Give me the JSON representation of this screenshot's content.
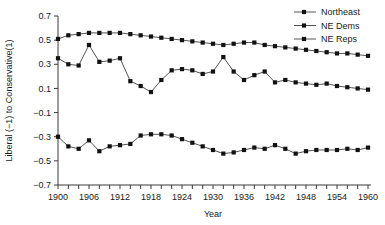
{
  "chart_data": {
    "type": "line",
    "title": "",
    "xlabel": "Year",
    "ylabel": "Liberal (−1) to Conservative(1)",
    "xlim": [
      1900,
      1960
    ],
    "ylim": [
      -0.7,
      0.7
    ],
    "xticks": [
      1900,
      1902,
      1904,
      1906,
      1908,
      1910,
      1912,
      1914,
      1916,
      1918,
      1920,
      1922,
      1924,
      1926,
      1928,
      1930,
      1932,
      1934,
      1936,
      1938,
      1940,
      1942,
      1944,
      1946,
      1948,
      1950,
      1952,
      1954,
      1956,
      1958,
      1960
    ],
    "xtick_labels": [
      "1900",
      "1906",
      "1912",
      "1918",
      "1924",
      "1930",
      "1936",
      "1942",
      "1948",
      "1954",
      "1960"
    ],
    "xtick_label_values": [
      1900,
      1906,
      1912,
      1918,
      1924,
      1930,
      1936,
      1942,
      1948,
      1954,
      1960
    ],
    "yticks": [
      -0.7,
      -0.5,
      -0.3,
      -0.1,
      0.1,
      0.3,
      0.5,
      0.7
    ],
    "ytick_labels": [
      "−0.7",
      "−0.5",
      "−0.3",
      "−0.1",
      "0.1",
      "0.3",
      "0.5",
      "0.7"
    ],
    "grid": false,
    "legend_position": "top-right",
    "marker": "square",
    "x": [
      1900,
      1902,
      1904,
      1906,
      1908,
      1910,
      1912,
      1914,
      1916,
      1918,
      1920,
      1922,
      1924,
      1926,
      1928,
      1930,
      1932,
      1934,
      1936,
      1938,
      1940,
      1942,
      1944,
      1946,
      1948,
      1950,
      1952,
      1954,
      1956,
      1958,
      1960
    ],
    "series": [
      {
        "name": "Northeast",
        "values": [
          0.35,
          0.3,
          0.29,
          0.46,
          0.32,
          0.33,
          0.35,
          0.16,
          0.12,
          0.07,
          0.17,
          0.25,
          0.26,
          0.25,
          0.22,
          0.24,
          0.36,
          0.24,
          0.17,
          0.21,
          0.24,
          0.15,
          0.17,
          0.15,
          0.14,
          0.13,
          0.14,
          0.12,
          0.11,
          0.1,
          0.09
        ]
      },
      {
        "name": "NE Dems",
        "values": [
          -0.3,
          -0.38,
          -0.4,
          -0.33,
          -0.42,
          -0.38,
          -0.37,
          -0.36,
          -0.29,
          -0.28,
          -0.28,
          -0.29,
          -0.32,
          -0.35,
          -0.38,
          -0.41,
          -0.44,
          -0.43,
          -0.41,
          -0.39,
          -0.4,
          -0.37,
          -0.4,
          -0.44,
          -0.42,
          -0.41,
          -0.41,
          -0.41,
          -0.4,
          -0.41,
          -0.39
        ]
      },
      {
        "name": "NE Reps",
        "values": [
          0.51,
          0.54,
          0.55,
          0.56,
          0.56,
          0.56,
          0.56,
          0.55,
          0.54,
          0.53,
          0.52,
          0.51,
          0.5,
          0.49,
          0.48,
          0.47,
          0.46,
          0.47,
          0.48,
          0.48,
          0.46,
          0.45,
          0.44,
          0.43,
          0.42,
          0.41,
          0.4,
          0.39,
          0.39,
          0.38,
          0.37
        ]
      }
    ]
  },
  "legend": {
    "items": [
      {
        "label": "Northeast"
      },
      {
        "label": "NE Dems"
      },
      {
        "label": "NE Reps"
      }
    ]
  },
  "colors": {
    "line": "#555555",
    "marker": "#111111",
    "axis": "#3a3a3a",
    "text": "#1a1a1a",
    "background": "#ffffff"
  }
}
